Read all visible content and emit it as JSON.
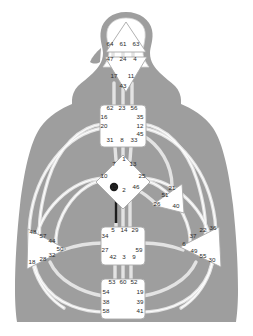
{
  "colors": {
    "body_silhouette": "#9e9e9e",
    "channel_stroke": "#d9d9d9",
    "center_fill": "#ffffff",
    "center_stroke": "#b0b0b0",
    "gate_text": "#2a2a2a",
    "activated_gate": "#1a1a1a",
    "background": "#ffffff"
  },
  "centers": [
    {
      "name": "head",
      "shape": "triangle-up",
      "defined": false,
      "gates": [
        {
          "num": "64",
          "x": 110,
          "y": 46
        },
        {
          "num": "61",
          "x": 123,
          "y": 46
        },
        {
          "num": "63",
          "x": 136,
          "y": 46
        }
      ]
    },
    {
      "name": "ajna",
      "shape": "triangle-down",
      "defined": false,
      "gates": [
        {
          "num": "47",
          "x": 110,
          "y": 61
        },
        {
          "num": "24",
          "x": 123,
          "y": 61
        },
        {
          "num": "4",
          "x": 135,
          "y": 61
        },
        {
          "num": "17",
          "x": 114,
          "y": 78
        },
        {
          "num": "11",
          "x": 131,
          "y": 78
        },
        {
          "num": "43",
          "x": 123,
          "y": 88
        }
      ]
    },
    {
      "name": "throat",
      "shape": "square",
      "defined": false,
      "gates": [
        {
          "num": "62",
          "x": 110,
          "y": 110
        },
        {
          "num": "23",
          "x": 122,
          "y": 110
        },
        {
          "num": "56",
          "x": 134,
          "y": 110
        },
        {
          "num": "16",
          "x": 104,
          "y": 119
        },
        {
          "num": "35",
          "x": 140,
          "y": 119
        },
        {
          "num": "20",
          "x": 104,
          "y": 128
        },
        {
          "num": "12",
          "x": 140,
          "y": 128
        },
        {
          "num": "45",
          "x": 140,
          "y": 136
        },
        {
          "num": "31",
          "x": 110,
          "y": 142
        },
        {
          "num": "8",
          "x": 122,
          "y": 142
        },
        {
          "num": "33",
          "x": 134,
          "y": 142
        }
      ]
    },
    {
      "name": "g-center",
      "shape": "diamond",
      "defined": false,
      "gates": [
        {
          "num": "1",
          "x": 124,
          "y": 161
        },
        {
          "num": "7",
          "x": 114,
          "y": 166
        },
        {
          "num": "13",
          "x": 133,
          "y": 166
        },
        {
          "num": "10",
          "x": 104,
          "y": 178
        },
        {
          "num": "25",
          "x": 142,
          "y": 178
        },
        {
          "num": "15",
          "x": 114,
          "y": 189,
          "activated": true
        },
        {
          "num": "2",
          "x": 124,
          "y": 192
        },
        {
          "num": "46",
          "x": 136,
          "y": 189
        }
      ]
    },
    {
      "name": "heart-ego",
      "shape": "triangle-right",
      "defined": false,
      "gates": [
        {
          "num": "21",
          "x": 172,
          "y": 190
        },
        {
          "num": "51",
          "x": 165,
          "y": 197
        },
        {
          "num": "26",
          "x": 157,
          "y": 206
        },
        {
          "num": "40",
          "x": 176,
          "y": 208
        }
      ]
    },
    {
      "name": "spleen",
      "shape": "triangle-left",
      "defined": false,
      "gates": [
        {
          "num": "48",
          "x": 33,
          "y": 234
        },
        {
          "num": "57",
          "x": 43,
          "y": 238
        },
        {
          "num": "44",
          "x": 52,
          "y": 243
        },
        {
          "num": "50",
          "x": 60,
          "y": 251
        },
        {
          "num": "32",
          "x": 52,
          "y": 257
        },
        {
          "num": "28",
          "x": 43,
          "y": 261
        },
        {
          "num": "18",
          "x": 32,
          "y": 264
        }
      ]
    },
    {
      "name": "sacral",
      "shape": "square",
      "defined": false,
      "gates": [
        {
          "num": "5",
          "x": 113,
          "y": 232
        },
        {
          "num": "14",
          "x": 124,
          "y": 232
        },
        {
          "num": "29",
          "x": 135,
          "y": 232
        },
        {
          "num": "34",
          "x": 105,
          "y": 238
        },
        {
          "num": "27",
          "x": 105,
          "y": 252
        },
        {
          "num": "59",
          "x": 139,
          "y": 252
        },
        {
          "num": "42",
          "x": 113,
          "y": 259
        },
        {
          "num": "3",
          "x": 124,
          "y": 259
        },
        {
          "num": "9",
          "x": 134,
          "y": 259
        }
      ]
    },
    {
      "name": "solar-plexus",
      "shape": "triangle-right",
      "defined": false,
      "gates": [
        {
          "num": "22",
          "x": 203,
          "y": 232
        },
        {
          "num": "36",
          "x": 213,
          "y": 230
        },
        {
          "num": "37",
          "x": 193,
          "y": 238
        },
        {
          "num": "6",
          "x": 184,
          "y": 246
        },
        {
          "num": "49",
          "x": 194,
          "y": 253
        },
        {
          "num": "55",
          "x": 203,
          "y": 258
        },
        {
          "num": "30",
          "x": 212,
          "y": 262
        }
      ]
    },
    {
      "name": "root",
      "shape": "square",
      "defined": false,
      "gates": [
        {
          "num": "53",
          "x": 112,
          "y": 284
        },
        {
          "num": "60",
          "x": 123,
          "y": 284
        },
        {
          "num": "52",
          "x": 134,
          "y": 284
        },
        {
          "num": "54",
          "x": 106,
          "y": 294
        },
        {
          "num": "19",
          "x": 140,
          "y": 294
        },
        {
          "num": "38",
          "x": 106,
          "y": 304
        },
        {
          "num": "39",
          "x": 140,
          "y": 304
        },
        {
          "num": "58",
          "x": 106,
          "y": 313
        },
        {
          "num": "41",
          "x": 140,
          "y": 313
        }
      ]
    }
  ]
}
